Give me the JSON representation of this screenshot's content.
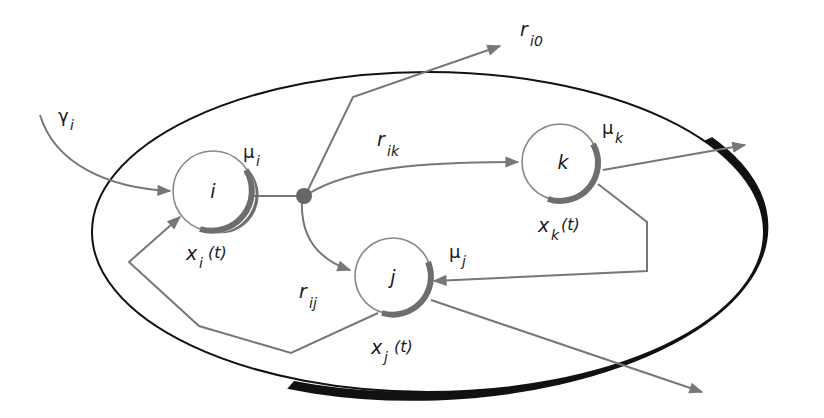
{
  "diagram": {
    "type": "compartment-flow-network",
    "colors": {
      "background": "#ffffff",
      "ellipse_stroke": "#111111",
      "flow_line": "#777777",
      "node_stroke": "#888888",
      "node_shadow": "#6e6e6e",
      "junction": "#666666",
      "text": "#1a1a1a"
    },
    "nodes": [
      {
        "id": "i",
        "label": "i",
        "rate_symbol": "μ",
        "rate_sub": "i",
        "state_symbol": "x",
        "state_sub": "i",
        "state_arg": "(t)"
      },
      {
        "id": "k",
        "label": "k",
        "rate_symbol": "μ",
        "rate_sub": "k",
        "state_symbol": "x",
        "state_sub": "k",
        "state_arg": "(t)"
      },
      {
        "id": "j",
        "label": "j",
        "rate_symbol": "μ",
        "rate_sub": "j",
        "state_symbol": "x",
        "state_sub": "j",
        "state_arg": "(t)"
      }
    ],
    "edges": [
      {
        "from": "external",
        "to": "i",
        "symbol": "γ",
        "sub": "i"
      },
      {
        "from": "i",
        "to": "junction"
      },
      {
        "from": "junction",
        "to": "outside",
        "symbol": "r",
        "sub": "i0"
      },
      {
        "from": "junction",
        "to": "k",
        "symbol": "r",
        "sub": "ik"
      },
      {
        "from": "junction",
        "to": "j",
        "symbol": "r",
        "sub": "ij"
      },
      {
        "from": "k",
        "to": "outside"
      },
      {
        "from": "k",
        "to": "j"
      },
      {
        "from": "j",
        "to": "i"
      },
      {
        "from": "j",
        "to": "outside"
      }
    ],
    "labels": {
      "gamma_i": {
        "symbol": "γ",
        "sub": "i"
      },
      "r_i0": {
        "symbol": "r",
        "sub": "i0"
      },
      "r_ik": {
        "symbol": "r",
        "sub": "ik"
      },
      "r_ij": {
        "symbol": "r",
        "sub": "ij"
      }
    }
  }
}
